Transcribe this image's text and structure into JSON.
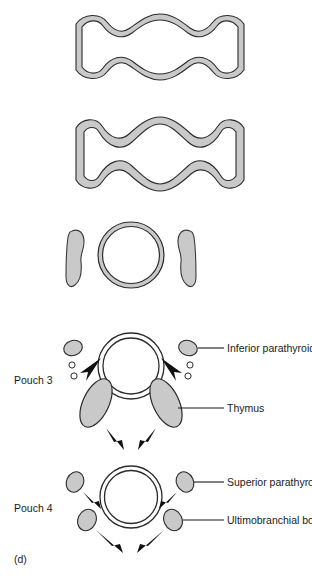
{
  "figure": {
    "panel_label": "(d)",
    "title_alt": "Pharyngeal pouch derivatives and their migration"
  },
  "colors": {
    "tissue_fill": "#c9c9c9",
    "tissue_stroke": "#3a3a3a",
    "outline_stroke": "#2b2b2b",
    "arrow_fill": "#111111",
    "leader_line": "#1a1a1a",
    "text": "#1a1a1a",
    "background": "#ffffff"
  },
  "stages": [
    {
      "id": "stage-1",
      "name": "pharyngeal-wall-stage-1",
      "description": "Wavy pharyngeal wall outline, shallow pouches"
    },
    {
      "id": "stage-2",
      "name": "pharyngeal-wall-stage-2",
      "description": "Wavy pharyngeal wall outline, deepened pouches"
    },
    {
      "id": "stage-3",
      "name": "trachea-with-lateral-masses",
      "description": "Trachea ring flanked by two elongated tissue masses"
    }
  ],
  "pouch_panels": [
    {
      "id": "pouch-3",
      "label": "Pouch 3",
      "annotations": [
        {
          "id": "inferior-parathyroid",
          "label": "Inferior parathyroid"
        },
        {
          "id": "thymus",
          "label": "Thymus"
        }
      ]
    },
    {
      "id": "pouch-4",
      "label": "Pouch 4",
      "annotations": [
        {
          "id": "superior-parathyroid",
          "label": "Superior parathyroid"
        },
        {
          "id": "ultimobranchial-body",
          "label": "Ultimobranchial body"
        }
      ]
    }
  ]
}
